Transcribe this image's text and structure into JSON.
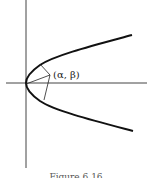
{
  "figure": {
    "point_label": "(α, β)",
    "caption": "Figure 6.16",
    "colors": {
      "curve": "#111111",
      "axis": "#444444",
      "background": "#ffffff"
    }
  },
  "diagram": {
    "type": "parabola opening right, vertex at origin",
    "axes": {
      "horizontal_y": 83,
      "vertical_x": 26
    },
    "segments_from_vertex_to_point": true
  }
}
